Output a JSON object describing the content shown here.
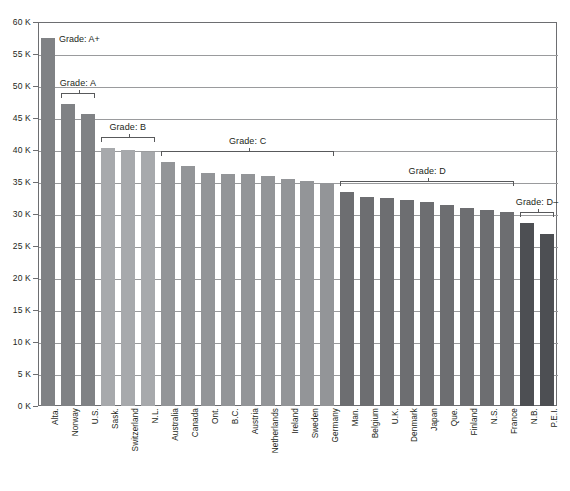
{
  "chart_data": {
    "type": "bar",
    "title": "",
    "subtitle": "",
    "xlabel": "",
    "ylabel": "",
    "ylim": [
      0,
      60000
    ],
    "grid": true,
    "legend": "none",
    "y_ticks": [
      {
        "value": 0,
        "label": "0 K"
      },
      {
        "value": 5000,
        "label": "5 K"
      },
      {
        "value": 10000,
        "label": "10 K"
      },
      {
        "value": 15000,
        "label": "15 K"
      },
      {
        "value": 20000,
        "label": "20 K"
      },
      {
        "value": 25000,
        "label": "25 K"
      },
      {
        "value": 30000,
        "label": "30 K"
      },
      {
        "value": 35000,
        "label": "35 K"
      },
      {
        "value": 40000,
        "label": "40 K"
      },
      {
        "value": 45000,
        "label": "45 K"
      },
      {
        "value": 50000,
        "label": "50 K"
      },
      {
        "value": 55000,
        "label": "55 K"
      },
      {
        "value": 60000,
        "label": "60 K"
      }
    ],
    "categories": [
      "Alta.",
      "Norway",
      "U.S.",
      "Sask.",
      "Switzerland",
      "N.L.",
      "Australia",
      "Canada",
      "Ont.",
      "B.C.",
      "Austria",
      "Netherlands",
      "Ireland",
      "Sweden",
      "Germany",
      "Man.",
      "Belgium",
      "U.K.",
      "Denmark",
      "Japan",
      "Que.",
      "Finland",
      "N.S.",
      "France",
      "N.B.",
      "P.E.I."
    ],
    "values": [
      57500,
      47200,
      45600,
      40300,
      40000,
      39700,
      38200,
      37500,
      36400,
      36300,
      36200,
      36000,
      35500,
      35100,
      34900,
      33500,
      32700,
      32500,
      32200,
      31900,
      31400,
      30900,
      30700,
      30300,
      28600,
      26800
    ],
    "bar_grades": [
      "A+",
      "A",
      "A",
      "B",
      "B",
      "B",
      "C",
      "C",
      "C",
      "C",
      "C",
      "C",
      "C",
      "C",
      "C",
      "D",
      "D",
      "D",
      "D",
      "D",
      "D",
      "D",
      "D",
      "D",
      "D-",
      "D-"
    ],
    "grade_groups": [
      {
        "label": "Grade: A+",
        "grade": "A+",
        "start_index": 0,
        "end_index": 0,
        "bracket": false,
        "color": "#808285"
      },
      {
        "label": "Grade: A",
        "grade": "A",
        "start_index": 1,
        "end_index": 2,
        "bracket": true,
        "color": "#808285"
      },
      {
        "label": "Grade: B",
        "grade": "B",
        "start_index": 3,
        "end_index": 5,
        "bracket": true,
        "color": "#a7a9ac"
      },
      {
        "label": "Grade: C",
        "grade": "C",
        "start_index": 6,
        "end_index": 14,
        "bracket": true,
        "color": "#939598"
      },
      {
        "label": "Grade: D",
        "grade": "D",
        "start_index": 15,
        "end_index": 23,
        "bracket": true,
        "color": "#6d6e71"
      },
      {
        "label": "Grade: D–",
        "grade": "D-",
        "start_index": 24,
        "end_index": 25,
        "bracket": true,
        "color": "#4d4f53"
      }
    ],
    "colors": {
      "grade_a_plus": "#808285",
      "grade_a": "#808285",
      "grade_b": "#a7a9ac",
      "grade_c": "#939598",
      "grade_d": "#6d6e71",
      "grade_d_minus": "#4d4f53",
      "gridline": "#9a9b9d",
      "frame": "#6d6e71",
      "text": "#231f20",
      "background": "#ffffff"
    }
  }
}
